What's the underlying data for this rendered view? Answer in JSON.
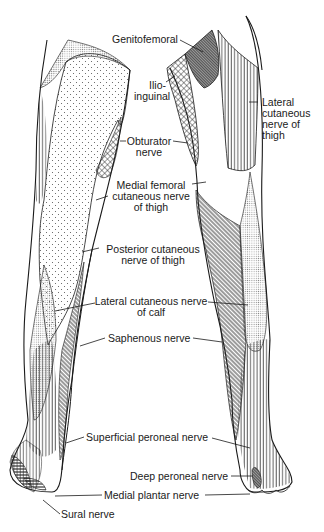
{
  "diagram": {
    "views": [
      "posterior left leg",
      "anterior right leg"
    ],
    "labels": [
      {
        "id": "genitofemoral",
        "text": "Genitofemoral"
      },
      {
        "id": "ilioinguinal",
        "line1": "Ilio-",
        "line2": "inguinal"
      },
      {
        "id": "lateral-cutaneous-thigh",
        "line1": "Lateral",
        "line2": "cutaneous",
        "line3": "nerve of",
        "line4": "thigh"
      },
      {
        "id": "obturator",
        "line1": "Obturator",
        "line2": "nerve"
      },
      {
        "id": "medial-femoral-cutaneous",
        "line1": "Medial femoral",
        "line2": "cutaneous nerve",
        "line3": "of thigh"
      },
      {
        "id": "posterior-cutaneous-thigh",
        "line1": "Posterior cutaneous",
        "line2": "nerve of thigh"
      },
      {
        "id": "lateral-cutaneous-calf",
        "line1": "Lateral cutaneous nerve",
        "line2": "of calf"
      },
      {
        "id": "saphenous",
        "text": "Saphenous nerve"
      },
      {
        "id": "superficial-peroneal",
        "text": "Superficial peroneal nerve"
      },
      {
        "id": "deep-peroneal",
        "text": "Deep peroneal nerve"
      },
      {
        "id": "medial-plantar",
        "text": "Medial plantar nerve"
      },
      {
        "id": "sural",
        "text": "Sural nerve"
      }
    ],
    "colors": {
      "line": "#1a1a1a",
      "background": "#ffffff",
      "stipple": "#9a9a9a",
      "genitofemoral_fill": "#6e6e6e"
    }
  }
}
